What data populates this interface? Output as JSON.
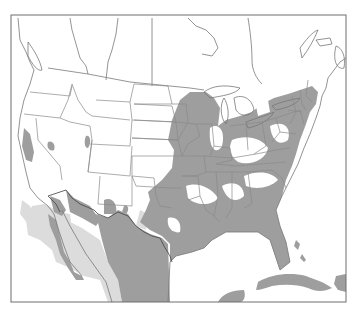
{
  "map": {
    "type": "species-range-map",
    "region": "North America (United States, southern Canada, Mexico, Caribbean)",
    "frame": {
      "x": 11,
      "y": 15,
      "width": 335,
      "height": 287
    },
    "colors": {
      "background": "#ffffff",
      "frame": "#6e6e6e",
      "borders": "#8a8a8a",
      "primary_range": "#9e9e9e",
      "secondary_range": "#dcdcdc"
    },
    "legend": [
      {
        "label": "",
        "color": "#9e9e9e"
      },
      {
        "label": "",
        "color": "#dcdcdc"
      }
    ],
    "text_labels": []
  }
}
